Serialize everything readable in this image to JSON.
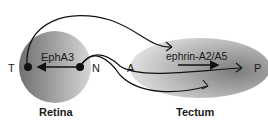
{
  "diagram": {
    "retina": {
      "label": "Retina",
      "gradient_label": "EphA3",
      "pole_left": "T",
      "pole_right": "N"
    },
    "tectum": {
      "label": "Tectum",
      "gradient_label": "ephrin-A2/A5",
      "pole_left": "A",
      "pole_right": "P"
    },
    "colors": {
      "retina_dark": "#7a7a7a",
      "retina_light": "#d0d0d0",
      "tectum_dark": "#8a8a8a",
      "tectum_light": "#e0e0e0",
      "line": "#111111"
    }
  }
}
